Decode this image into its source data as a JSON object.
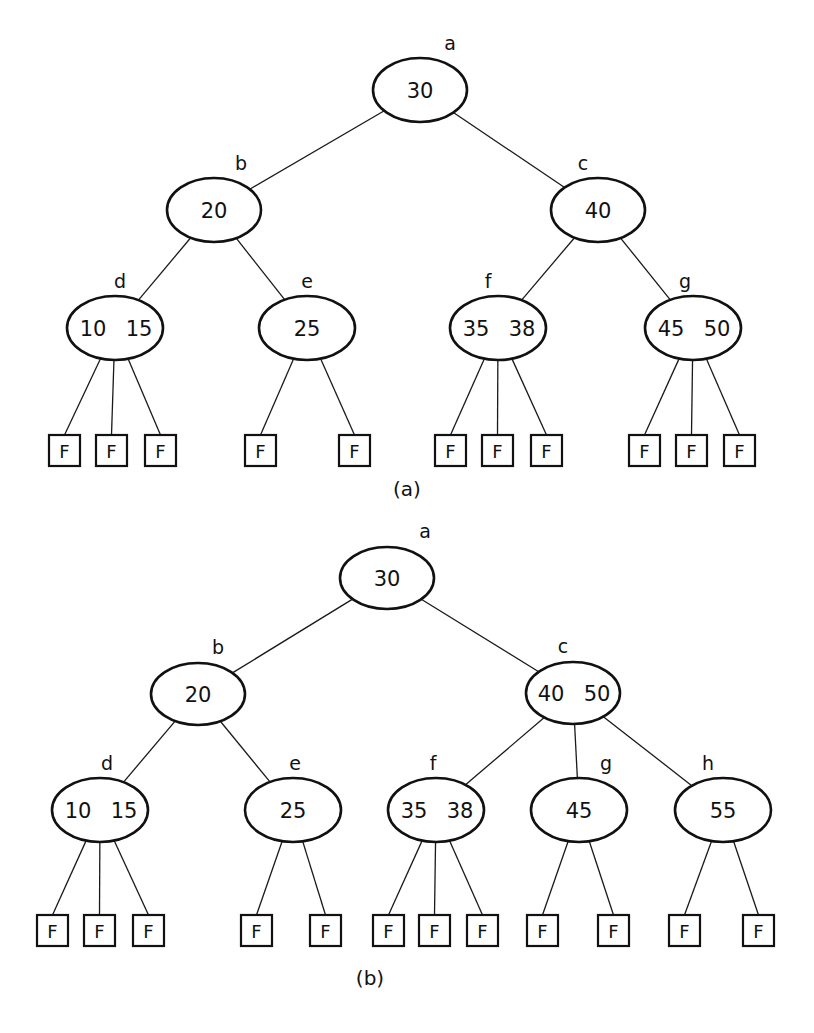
{
  "figure": {
    "type": "2-3 tree insertion example",
    "colors": {
      "ink": "#111111",
      "background": "#ffffff"
    }
  },
  "trees": [
    {
      "caption": "(a)",
      "caption_pos": {
        "x": 407,
        "y": 496
      },
      "nodes": [
        {
          "id": "a",
          "label": "a",
          "keys": [
            "30"
          ],
          "cx": 420,
          "cy": 90,
          "rx": 47,
          "ry": 32,
          "label_dx": 30,
          "label_dy": -40
        },
        {
          "id": "b",
          "label": "b",
          "keys": [
            "20"
          ],
          "cx": 214,
          "cy": 210,
          "rx": 47,
          "ry": 32,
          "label_dx": 27,
          "label_dy": -40
        },
        {
          "id": "c",
          "label": "c",
          "keys": [
            "40"
          ],
          "cx": 598,
          "cy": 210,
          "rx": 47,
          "ry": 32,
          "label_dx": -15,
          "label_dy": -40
        },
        {
          "id": "d",
          "label": "d",
          "keys": [
            "10",
            "15"
          ],
          "cx": 115,
          "cy": 328,
          "rx": 48,
          "ry": 32,
          "label_dx": 5,
          "label_dy": -40
        },
        {
          "id": "e",
          "label": "e",
          "keys": [
            "25"
          ],
          "cx": 307,
          "cy": 328,
          "rx": 48,
          "ry": 32,
          "label_dx": 0,
          "label_dy": -40
        },
        {
          "id": "f",
          "label": "f",
          "keys": [
            "35",
            "38"
          ],
          "cx": 498,
          "cy": 328,
          "rx": 48,
          "ry": 32,
          "label_dx": -10,
          "label_dy": -40
        },
        {
          "id": "g",
          "label": "g",
          "keys": [
            "45",
            "50"
          ],
          "cx": 693,
          "cy": 328,
          "rx": 48,
          "ry": 32,
          "label_dx": -8,
          "label_dy": -40
        }
      ],
      "edges": [
        [
          "a",
          "b"
        ],
        [
          "a",
          "c"
        ],
        [
          "b",
          "d"
        ],
        [
          "b",
          "e"
        ],
        [
          "c",
          "f"
        ],
        [
          "c",
          "g"
        ]
      ],
      "failure_nodes": [
        {
          "parent": "d",
          "label": "F",
          "x": 49,
          "y": 435
        },
        {
          "parent": "d",
          "label": "F",
          "x": 96,
          "y": 435
        },
        {
          "parent": "d",
          "label": "F",
          "x": 145,
          "y": 435
        },
        {
          "parent": "e",
          "label": "F",
          "x": 245,
          "y": 435
        },
        {
          "parent": "e",
          "label": "F",
          "x": 339,
          "y": 435
        },
        {
          "parent": "f",
          "label": "F",
          "x": 435,
          "y": 435
        },
        {
          "parent": "f",
          "label": "F",
          "x": 482,
          "y": 435
        },
        {
          "parent": "f",
          "label": "F",
          "x": 531,
          "y": 435
        },
        {
          "parent": "g",
          "label": "F",
          "x": 629,
          "y": 435
        },
        {
          "parent": "g",
          "label": "F",
          "x": 676,
          "y": 435
        },
        {
          "parent": "g",
          "label": "F",
          "x": 724,
          "y": 435
        }
      ]
    },
    {
      "caption": "(b)",
      "caption_pos": {
        "x": 370,
        "y": 985
      },
      "nodes": [
        {
          "id": "a",
          "label": "a",
          "keys": [
            "30"
          ],
          "cx": 387,
          "cy": 578,
          "rx": 47,
          "ry": 31,
          "label_dx": 38,
          "label_dy": -40
        },
        {
          "id": "b",
          "label": "b",
          "keys": [
            "20"
          ],
          "cx": 198,
          "cy": 694,
          "rx": 47,
          "ry": 31,
          "label_dx": 20,
          "label_dy": -40
        },
        {
          "id": "c",
          "label": "c",
          "keys": [
            "40",
            "50"
          ],
          "cx": 573,
          "cy": 693,
          "rx": 47,
          "ry": 31,
          "label_dx": -10,
          "label_dy": -40
        },
        {
          "id": "d",
          "label": "d",
          "keys": [
            "10",
            "15"
          ],
          "cx": 100,
          "cy": 810,
          "rx": 48,
          "ry": 32,
          "label_dx": 7,
          "label_dy": -40
        },
        {
          "id": "e",
          "label": "e",
          "keys": [
            "25"
          ],
          "cx": 293,
          "cy": 810,
          "rx": 48,
          "ry": 32,
          "label_dx": 2,
          "label_dy": -40
        },
        {
          "id": "f",
          "label": "f",
          "keys": [
            "35",
            "38"
          ],
          "cx": 436,
          "cy": 810,
          "rx": 48,
          "ry": 32,
          "label_dx": -3,
          "label_dy": -40
        },
        {
          "id": "g",
          "label": "g",
          "keys": [
            "45"
          ],
          "cx": 579,
          "cy": 810,
          "rx": 48,
          "ry": 32,
          "label_dx": 27,
          "label_dy": -40
        },
        {
          "id": "h",
          "label": "h",
          "keys": [
            "55"
          ],
          "cx": 723,
          "cy": 810,
          "rx": 48,
          "ry": 32,
          "label_dx": -15,
          "label_dy": -40
        }
      ],
      "edges": [
        [
          "a",
          "b"
        ],
        [
          "a",
          "c"
        ],
        [
          "b",
          "d"
        ],
        [
          "b",
          "e"
        ],
        [
          "c",
          "f"
        ],
        [
          "c",
          "g"
        ],
        [
          "c",
          "h"
        ]
      ],
      "failure_nodes": [
        {
          "parent": "d",
          "label": "F",
          "x": 37,
          "y": 915
        },
        {
          "parent": "d",
          "label": "F",
          "x": 84,
          "y": 915
        },
        {
          "parent": "d",
          "label": "F",
          "x": 133,
          "y": 915
        },
        {
          "parent": "e",
          "label": "F",
          "x": 241,
          "y": 915
        },
        {
          "parent": "e",
          "label": "F",
          "x": 310,
          "y": 915
        },
        {
          "parent": "f",
          "label": "F",
          "x": 373,
          "y": 915
        },
        {
          "parent": "f",
          "label": "F",
          "x": 419,
          "y": 915
        },
        {
          "parent": "f",
          "label": "F",
          "x": 467,
          "y": 915
        },
        {
          "parent": "g",
          "label": "F",
          "x": 527,
          "y": 915
        },
        {
          "parent": "g",
          "label": "F",
          "x": 598,
          "y": 915
        },
        {
          "parent": "h",
          "label": "F",
          "x": 669,
          "y": 915
        },
        {
          "parent": "h",
          "label": "F",
          "x": 743,
          "y": 915
        }
      ]
    }
  ]
}
